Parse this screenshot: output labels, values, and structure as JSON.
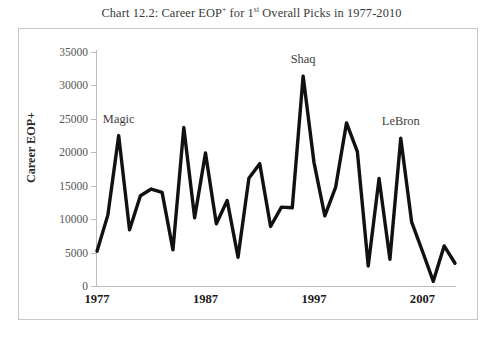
{
  "figure": {
    "title_prefix": "Chart 12.2: Career EOP",
    "title_sup1": "+",
    "title_mid": " for 1",
    "title_sup2": "st",
    "title_suffix": " Overall Picks in 1977-2010",
    "title_full": "Chart 12.2: Career EOP+ for 1st Overall Picks in 1977-2010",
    "frame_color": "#c9c9c9",
    "line_color": "#111111",
    "axis_color": "#bdbdbd"
  },
  "chart_data": {
    "type": "line",
    "title": "Chart 12.2: Career EOP+ for 1st Overall Picks in 1977-2010",
    "xlabel": "",
    "ylabel": "Career EOP+",
    "ylim": [
      0,
      35000
    ],
    "ytick_values": [
      0,
      5000,
      10000,
      15000,
      20000,
      25000,
      30000,
      35000
    ],
    "ytick_labels": [
      "0",
      "5000",
      "10000",
      "15000",
      "20000",
      "25000",
      "30000",
      "35000"
    ],
    "xlim": [
      1977,
      2010
    ],
    "xtick_values": [
      1977,
      1987,
      1997,
      2007
    ],
    "xtick_labels": [
      "1977",
      "1987",
      "1997",
      "2007"
    ],
    "grid": false,
    "legend": "none",
    "x": [
      1977,
      1978,
      1979,
      1980,
      1981,
      1982,
      1983,
      1984,
      1985,
      1986,
      1987,
      1988,
      1989,
      1990,
      1991,
      1992,
      1993,
      1994,
      1995,
      1996,
      1997,
      1998,
      1999,
      2000,
      2001,
      2002,
      2003,
      2004,
      2005,
      2006,
      2007,
      2008,
      2009,
      2010
    ],
    "values": [
      5200,
      10600,
      22500,
      8400,
      13500,
      14500,
      14000,
      5400,
      23700,
      10200,
      19900,
      9300,
      12800,
      4300,
      16100,
      18300,
      8900,
      11800,
      11700,
      31400,
      18500,
      10500,
      14800,
      24400,
      20100,
      3000,
      16100,
      4000,
      22100,
      9600,
      5200,
      700,
      6000,
      3400
    ],
    "series": [
      {
        "name": "Career EOP+",
        "values": [
          5200,
          10600,
          22500,
          8400,
          13500,
          14500,
          14000,
          5400,
          23700,
          10200,
          19900,
          9300,
          12800,
          4300,
          16100,
          18300,
          8900,
          11800,
          11700,
          31400,
          18500,
          10500,
          14800,
          24400,
          20100,
          3000,
          16100,
          4000,
          22100,
          9600,
          5200,
          700,
          6000,
          3400
        ]
      }
    ],
    "annotations": [
      {
        "label": "Magic",
        "x": 1979,
        "y": 22500,
        "note": "1979 peak"
      },
      {
        "label": "Shaq",
        "x": 1996,
        "y": 31400,
        "note": "1996 peak"
      },
      {
        "label": "LeBron",
        "x": 2005,
        "y": 22100,
        "note": "2005 peak"
      }
    ]
  }
}
